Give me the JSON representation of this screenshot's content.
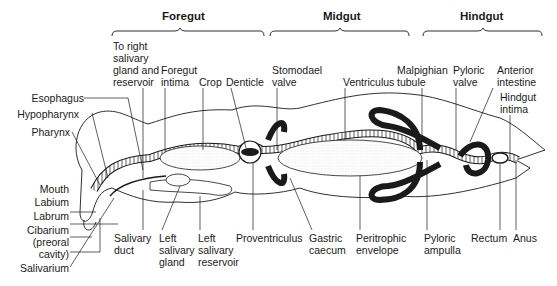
{
  "figure": {
    "sections": [
      {
        "name": "Foregut"
      },
      {
        "name": "Midgut"
      },
      {
        "name": "Hindgut"
      }
    ],
    "top_labels": [
      {
        "text": "To right\nsalivary\ngland and\nreservoir"
      },
      {
        "text": "Foregut\nintima"
      },
      {
        "text": "Crop"
      },
      {
        "text": "Denticle"
      },
      {
        "text": "Stomodael\nvalve"
      },
      {
        "text": "Ventriculus"
      },
      {
        "text": "Malpighian\ntubule"
      },
      {
        "text": "Pyloric\nvalve"
      },
      {
        "text": "Anterior\nintestine"
      },
      {
        "text": "Hindgut\nintima"
      }
    ],
    "left_labels": [
      {
        "text": "Esophagus"
      },
      {
        "text": "Hypopharynx"
      },
      {
        "text": "Pharynx"
      },
      {
        "text": "Mouth"
      },
      {
        "text": "Labium"
      },
      {
        "text": "Labrum"
      },
      {
        "text": "Cibarium\n(preoral\ncavity)"
      },
      {
        "text": "Salivarium"
      }
    ],
    "bottom_labels": [
      {
        "text": "Salivary\nduct"
      },
      {
        "text": "Left\nsalivary\ngland"
      },
      {
        "text": "Left\nsalivary\nreservoir"
      },
      {
        "text": "Proventriculus"
      },
      {
        "text": "Gastric\ncaecum"
      },
      {
        "text": "Peritrophic\nenvelope"
      },
      {
        "text": "Pyloric\nampulla"
      },
      {
        "text": "Rectum"
      },
      {
        "text": "Anus"
      }
    ],
    "colors": {
      "ink": "#1a1a1a",
      "stipple": "#d8d8d8",
      "paper": "#ffffff"
    }
  }
}
